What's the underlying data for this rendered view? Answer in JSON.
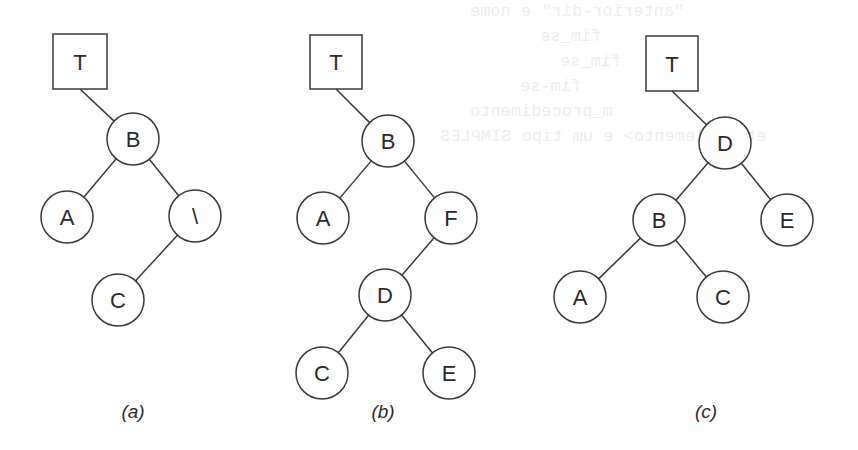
{
  "figure": {
    "stroke_color": "#3a3a3a",
    "text_color": "#2a2a2a",
    "background": "#ffffff",
    "node_radius": 26,
    "panels": [
      {
        "id": "a",
        "caption": "(a)",
        "caption_pos": [
          133,
          418
        ],
        "root_pointer": {
          "label": "T",
          "box": [
            53,
            34,
            54,
            55
          ]
        },
        "nodes": [
          {
            "id": "B",
            "label": "B",
            "x": 133,
            "y": 139
          },
          {
            "id": "A",
            "label": "A",
            "x": 67,
            "y": 217
          },
          {
            "id": "X",
            "label": "\\",
            "x": 195,
            "y": 216
          },
          {
            "id": "C",
            "label": "C",
            "x": 118,
            "y": 300
          }
        ],
        "edges": [
          {
            "from": "T",
            "to": "B"
          },
          {
            "from": "B",
            "to": "A"
          },
          {
            "from": "B",
            "to": "X"
          },
          {
            "from": "X",
            "to": "C"
          }
        ]
      },
      {
        "id": "b",
        "caption": "(b)",
        "caption_pos": [
          383,
          418
        ],
        "root_pointer": {
          "label": "T",
          "box": [
            310,
            35,
            52,
            54
          ]
        },
        "nodes": [
          {
            "id": "B",
            "label": "B",
            "x": 388,
            "y": 141
          },
          {
            "id": "A",
            "label": "A",
            "x": 323,
            "y": 218
          },
          {
            "id": "F",
            "label": "F",
            "x": 451,
            "y": 218
          },
          {
            "id": "D",
            "label": "D",
            "x": 385,
            "y": 295
          },
          {
            "id": "C",
            "label": "C",
            "x": 322,
            "y": 373
          },
          {
            "id": "E",
            "label": "E",
            "x": 449,
            "y": 373
          }
        ],
        "edges": [
          {
            "from": "T",
            "to": "B"
          },
          {
            "from": "B",
            "to": "A"
          },
          {
            "from": "B",
            "to": "F"
          },
          {
            "from": "F",
            "to": "D"
          },
          {
            "from": "D",
            "to": "C"
          },
          {
            "from": "D",
            "to": "E"
          }
        ]
      },
      {
        "id": "c",
        "caption": "(c)",
        "caption_pos": [
          706,
          418
        ],
        "root_pointer": {
          "label": "T",
          "box": [
            646,
            36,
            52,
            55
          ]
        },
        "nodes": [
          {
            "id": "D",
            "label": "D",
            "x": 725,
            "y": 143
          },
          {
            "id": "B",
            "label": "B",
            "x": 659,
            "y": 220
          },
          {
            "id": "E",
            "label": "E",
            "x": 787,
            "y": 220
          },
          {
            "id": "A",
            "label": "A",
            "x": 580,
            "y": 297
          },
          {
            "id": "C",
            "label": "C",
            "x": 723,
            "y": 297
          }
        ],
        "edges": [
          {
            "from": "T",
            "to": "D"
          },
          {
            "from": "D",
            "to": "B"
          },
          {
            "from": "D",
            "to": "E"
          },
          {
            "from": "B",
            "to": "A"
          },
          {
            "from": "B",
            "to": "C"
          }
        ]
      }
    ]
  },
  "bleed_through": {
    "lines": [
      {
        "text": "\"anterior-dir\" e nome",
        "x": 470,
        "y": 2
      },
      {
        "text": "fim_se",
        "x": 540,
        "y": 27
      },
      {
        "text": "fim_se",
        "x": 560,
        "y": 52
      },
      {
        "text": "fim-se",
        "x": 520,
        "y": 77
      },
      {
        "text": "m_procedimento",
        "x": 470,
        "y": 102
      },
      {
        "text": "etro elemento> e um tipo SIMPLES",
        "x": 440,
        "y": 127
      }
    ]
  }
}
